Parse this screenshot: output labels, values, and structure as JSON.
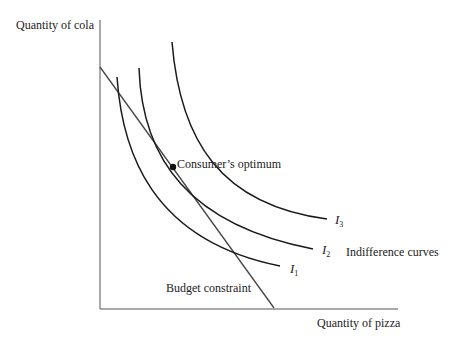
{
  "diagram": {
    "type": "indifference-curve-optimum",
    "y_axis_label": "Quantity of cola",
    "x_axis_label": "Quantity of pizza",
    "budget_constraint_label": "Budget constraint",
    "optimum_label": "Consumer’s optimum",
    "indifference_curves_label": "Indifference curves",
    "curves": [
      {
        "name": "I",
        "sub": "1"
      },
      {
        "name": "I",
        "sub": "2"
      },
      {
        "name": "I",
        "sub": "3"
      }
    ],
    "colors": {
      "line": "#1a1a1a",
      "axis": "#555555",
      "text": "#222222"
    }
  }
}
